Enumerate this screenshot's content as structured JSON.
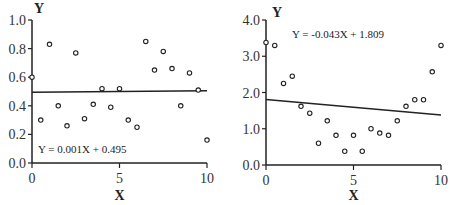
{
  "chart_data": [
    {
      "type": "scatter",
      "title": "",
      "xlabel": "X",
      "ylabel": "Y",
      "xlim": [
        0,
        10
      ],
      "ylim": [
        0,
        1.0
      ],
      "x_ticks": [
        0,
        5,
        10
      ],
      "y_ticks": [
        "0.0",
        "0.2",
        "0.4",
        "0.6",
        "0.8",
        "1.0"
      ],
      "grid": false,
      "regression": {
        "slope": 0.001,
        "intercept": 0.495,
        "label": "Y = 0.001X + 0.495"
      },
      "points": [
        [
          0,
          0.6
        ],
        [
          0.5,
          0.3
        ],
        [
          1,
          0.83
        ],
        [
          1.5,
          0.4
        ],
        [
          2,
          0.26
        ],
        [
          2.5,
          0.77
        ],
        [
          3,
          0.31
        ],
        [
          3.5,
          0.41
        ],
        [
          4,
          0.52
        ],
        [
          4.5,
          0.39
        ],
        [
          5,
          0.52
        ],
        [
          5.5,
          0.3
        ],
        [
          6,
          0.25
        ],
        [
          6.5,
          0.85
        ],
        [
          7,
          0.65
        ],
        [
          7.5,
          0.78
        ],
        [
          8,
          0.66
        ],
        [
          8.5,
          0.4
        ],
        [
          9,
          0.63
        ],
        [
          9.5,
          0.51
        ],
        [
          10,
          0.16
        ]
      ]
    },
    {
      "type": "scatter",
      "title": "",
      "xlabel": "X",
      "ylabel": "Y",
      "xlim": [
        0,
        10
      ],
      "ylim": [
        0,
        4.0
      ],
      "x_ticks": [
        0,
        5,
        10
      ],
      "y_ticks": [
        "0.0",
        "1.0",
        "2.0",
        "3.0",
        "4.0"
      ],
      "grid": false,
      "regression": {
        "slope": -0.043,
        "intercept": 1.809,
        "label": "Y =  -0.043X + 1.809"
      },
      "points": [
        [
          0,
          3.38
        ],
        [
          0.5,
          3.3
        ],
        [
          1,
          2.25
        ],
        [
          1.5,
          2.45
        ],
        [
          2,
          1.62
        ],
        [
          2.5,
          1.43
        ],
        [
          3,
          0.6
        ],
        [
          3.5,
          1.22
        ],
        [
          4,
          0.82
        ],
        [
          4.5,
          0.38
        ],
        [
          5,
          0.82
        ],
        [
          5.5,
          0.38
        ],
        [
          6,
          1.0
        ],
        [
          6.5,
          0.88
        ],
        [
          7,
          0.82
        ],
        [
          7.5,
          1.22
        ],
        [
          8,
          1.62
        ],
        [
          8.5,
          1.8
        ],
        [
          9,
          1.8
        ],
        [
          9.5,
          2.57
        ],
        [
          10,
          3.3
        ]
      ]
    }
  ]
}
